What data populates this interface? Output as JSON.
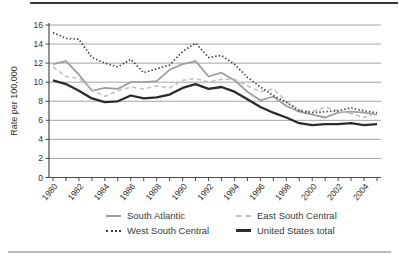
{
  "figure": {
    "ylabel": "Rate per 100,000",
    "y_tick_labels": [
      "0",
      "2",
      "4",
      "6",
      "8",
      "10",
      "12",
      "14",
      "16"
    ],
    "x_tick_labels": [
      "1980",
      "1982",
      "1984",
      "1986",
      "1988",
      "1990",
      "1992",
      "1994",
      "1996",
      "1998",
      "2000",
      "2002",
      "2004"
    ]
  },
  "colors": {
    "axis": "#4a4a4a",
    "gridline": "#9a9a9a",
    "tick_text": "#2f2f2f",
    "top_border": "#3a3a3a",
    "bottom_rule": "#bcbcbc"
  },
  "chart_data": {
    "type": "line",
    "title": "",
    "xlabel": "",
    "ylabel": "Rate per 100,000",
    "ylim": [
      0,
      16
    ],
    "yticks": [
      0,
      2,
      4,
      6,
      8,
      10,
      12,
      14,
      16
    ],
    "grid": "horizontal",
    "legend_position": "bottom",
    "x": [
      1980,
      1981,
      1982,
      1983,
      1984,
      1985,
      1986,
      1987,
      1988,
      1989,
      1990,
      1991,
      1992,
      1993,
      1994,
      1995,
      1996,
      1997,
      1998,
      1999,
      2000,
      2001,
      2002,
      2003,
      2004,
      2005
    ],
    "xticklabels": [
      "1980",
      "1982",
      "1984",
      "1986",
      "1988",
      "1990",
      "1992",
      "1994",
      "1996",
      "1998",
      "2000",
      "2002",
      "2004"
    ],
    "series": [
      {
        "name": "South Atlantic",
        "line_style": "solid",
        "color": "#9e9e9e",
        "weight": 1.8,
        "values": [
          11.9,
          12.2,
          10.8,
          9.1,
          9.4,
          9.3,
          10.0,
          10.0,
          10.1,
          11.3,
          11.9,
          12.2,
          10.6,
          11.0,
          10.2,
          9.0,
          8.1,
          8.5,
          7.5,
          6.9,
          6.6,
          6.3,
          6.8,
          6.9,
          6.8,
          6.6
        ]
      },
      {
        "name": "East South Central",
        "line_style": "dashed",
        "color": "#c2c2c2",
        "weight": 1.6,
        "values": [
          11.6,
          10.6,
          10.4,
          9.2,
          8.5,
          9.1,
          9.5,
          9.3,
          9.6,
          9.4,
          10.2,
          10.4,
          10.0,
          10.3,
          10.3,
          9.6,
          9.0,
          9.3,
          8.0,
          7.1,
          6.9,
          7.4,
          7.0,
          6.7,
          6.3,
          6.8
        ]
      },
      {
        "name": "West South Central",
        "line_style": "dotted",
        "color": "#3d3d3d",
        "weight": 1.7,
        "values": [
          15.2,
          14.6,
          14.5,
          12.6,
          12.0,
          11.6,
          12.4,
          11.0,
          11.4,
          11.8,
          13.2,
          14.1,
          12.6,
          12.8,
          11.9,
          10.5,
          9.5,
          8.6,
          7.9,
          7.0,
          6.8,
          6.9,
          7.0,
          7.3,
          7.0,
          6.8
        ]
      },
      {
        "name": "United States total",
        "line_style": "solid",
        "color": "#2b2b2b",
        "weight": 2.3,
        "values": [
          10.2,
          9.8,
          9.1,
          8.3,
          7.9,
          8.0,
          8.6,
          8.3,
          8.4,
          8.7,
          9.4,
          9.8,
          9.3,
          9.5,
          9.0,
          8.2,
          7.4,
          6.8,
          6.3,
          5.7,
          5.5,
          5.6,
          5.6,
          5.7,
          5.5,
          5.6
        ]
      }
    ]
  }
}
